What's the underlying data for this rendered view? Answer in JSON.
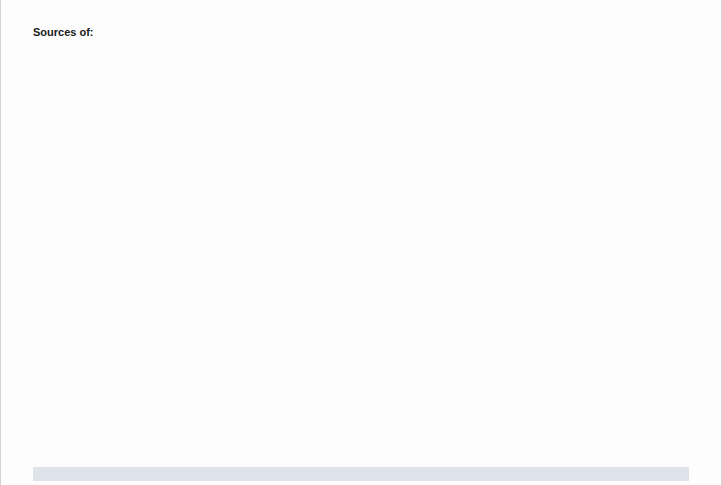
{
  "title_label": "Sources of:",
  "axis": {
    "ticks": [
      0,
      20,
      40,
      60,
      80,
      100
    ],
    "min": 0,
    "max": 100
  },
  "footnote_marker": "**",
  "colors": {
    "saturated_header": "#7e9152",
    "saturated_bar": "#8a9a5b",
    "monounsaturated_header": "#cd2b26",
    "monounsaturated_bar": "#d9635c",
    "polyunsaturated_header": "#5b93a0",
    "polyunsaturated_bar": "#6f9fae",
    "trans_header": "#8069b8",
    "trans_bar": "#9b86c8",
    "panel_background": "#e7ebd5"
  },
  "chart_data": {
    "type": "bar",
    "xlabel": "",
    "ylabel": "",
    "xlim": [
      0,
      100
    ],
    "grid": true,
    "legend_position": "top",
    "columns": [
      {
        "id": "saturated",
        "line1": "Saturated",
        "line2": "Fatty Acids"
      },
      {
        "id": "monounsaturated",
        "line1": "Monounsaturated",
        "line2": "Fatty Acids"
      },
      {
        "id": "polyunsaturated",
        "line1": "Polyunsaturated",
        "line2": "Fatty Acids"
      },
      {
        "id": "trans",
        "line1_pre": "Primarily ",
        "line1_em": "Trans",
        "line2": "Fatty Acids"
      }
    ],
    "groups": [
      {
        "heading": "Saturated Fatty Acids",
        "heading_em": "",
        "rows": [
          {
            "label": "Coconut oil",
            "footnote": "",
            "values": [
              87,
              6,
              2,
              0
            ]
          },
          {
            "label": "Butter",
            "footnote": "",
            "values": [
              62,
              29,
              4,
              4
            ],
            "marker": "**"
          },
          {
            "label": "Palm oil",
            "footnote": "",
            "values": [
              49,
              37,
              9,
              0
            ]
          },
          {
            "label": "Lard or beef fat",
            "footnote": "",
            "values": [
              41,
              47,
              4,
              0
            ]
          }
        ]
      },
      {
        "heading": "Monounsaturated",
        "heading2": "Fatty Acids",
        "rows": [
          {
            "label": "Olive oil",
            "footnote": "",
            "values": [
              14,
              73,
              8,
              0
            ]
          },
          {
            "label": "Canola oil",
            "footnote": "*",
            "values": [
              7,
              58,
              29,
              0
            ]
          },
          {
            "label": "Peanut oil",
            "footnote": "",
            "values": [
              17,
              46,
              32,
              0
            ]
          }
        ]
      },
      {
        "heading": "Polyunsaturated",
        "heading2": "Fatty Acids",
        "rows": [
          {
            "label": "Safflower oil",
            "footnote": "",
            "values": [
              9,
              12,
              75,
              0
            ]
          },
          {
            "label": "Sunflower oil",
            "footnote": "",
            "values": [
              10,
              20,
              66,
              0
            ]
          },
          {
            "label": "Corn oil",
            "footnote": "",
            "values": [
              13,
              24,
              59,
              0
            ]
          },
          {
            "label": "Soybean oil",
            "footnote": "*",
            "values": [
              15,
              23,
              54,
              0
            ]
          }
        ]
      },
      {
        "heading_em": "Trans",
        "heading_post": " Fatty Acids",
        "rows": [
          {
            "label": "Tub margarine",
            "footnote": "",
            "values": [
              10,
              21,
              43,
              5
            ]
          },
          {
            "label": "Stick margarine",
            "footnote": "",
            "values": [
              13,
              20,
              26,
              19
            ]
          },
          {
            "label": "Shortening",
            "footnote": "",
            "values": [
              20,
              17,
              8,
              23
            ]
          }
        ]
      }
    ]
  }
}
